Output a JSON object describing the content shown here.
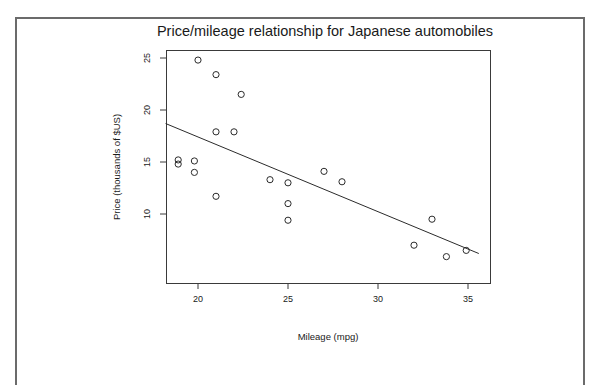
{
  "chart_data": {
    "type": "scatter",
    "title": "Price/mileage relationship for Japanese automobiles",
    "xlabel": "Mileage (mpg)",
    "ylabel": "Price (thousands of $US)",
    "xlim": [
      18.2,
      35.6
    ],
    "ylim": [
      5.2,
      25.4
    ],
    "xticks": [
      20,
      25,
      30,
      35
    ],
    "yticks": [
      10,
      15,
      20,
      25
    ],
    "xtick_labels": [
      "20",
      "25",
      "30",
      "35"
    ],
    "ytick_labels": [
      "10",
      "15",
      "20",
      "25"
    ],
    "grid": false,
    "legend": "none",
    "marker": "open-circle",
    "points": [
      {
        "x": 20.0,
        "y": 24.8
      },
      {
        "x": 21.0,
        "y": 23.4
      },
      {
        "x": 22.4,
        "y": 21.5
      },
      {
        "x": 21.0,
        "y": 17.9
      },
      {
        "x": 22.0,
        "y": 17.9
      },
      {
        "x": 18.9,
        "y": 15.2
      },
      {
        "x": 18.9,
        "y": 14.8
      },
      {
        "x": 19.8,
        "y": 15.1
      },
      {
        "x": 19.8,
        "y": 14.0
      },
      {
        "x": 21.0,
        "y": 11.7
      },
      {
        "x": 24.0,
        "y": 13.3
      },
      {
        "x": 25.0,
        "y": 13.0
      },
      {
        "x": 25.0,
        "y": 11.0
      },
      {
        "x": 25.0,
        "y": 9.4
      },
      {
        "x": 27.0,
        "y": 14.1
      },
      {
        "x": 28.0,
        "y": 13.1
      },
      {
        "x": 32.0,
        "y": 7.0
      },
      {
        "x": 33.0,
        "y": 9.5
      },
      {
        "x": 33.8,
        "y": 5.9
      },
      {
        "x": 34.9,
        "y": 6.5
      }
    ],
    "fit_line": {
      "name": "least-squares fit",
      "x_start": 18.2,
      "y_start": 18.7,
      "x_end": 35.6,
      "y_end": 6.2
    }
  }
}
